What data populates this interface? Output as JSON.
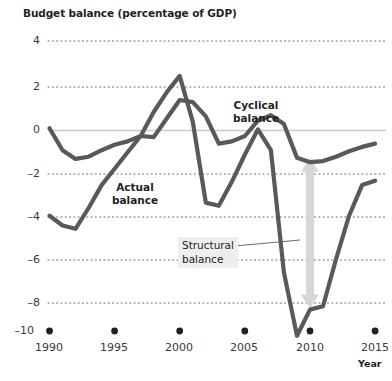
{
  "chart_data": {
    "type": "line",
    "title": "Budget balance (percentage of GDP)",
    "xlabel": "Year",
    "ylabel": "",
    "xlim": [
      1989,
      2015.6
    ],
    "ylim": [
      -10,
      4
    ],
    "grid": true,
    "grid_style": "dotted-horizontal",
    "legend_position": "inline-annotations",
    "x_ticks": [
      "1990",
      "1995",
      "2000",
      "2005",
      "2010",
      "2015"
    ],
    "x_tick_values": [
      1990,
      1995,
      2000,
      2005,
      2010,
      2015
    ],
    "y_ticks": [
      "4",
      "2",
      "0",
      "–2",
      "–4",
      "–6",
      "–8",
      "–10"
    ],
    "y_tick_values": [
      4,
      2,
      0,
      -2,
      -4,
      -6,
      -8,
      -10
    ],
    "x": [
      1990,
      1991,
      1992,
      1993,
      1994,
      1995,
      1996,
      1997,
      1998,
      1999,
      2000,
      2001,
      2002,
      2003,
      2004,
      2005,
      2006,
      2007,
      2008,
      2009,
      2010,
      2011,
      2012,
      2013,
      2014,
      2015
    ],
    "series": [
      {
        "name": "Cyclical balance",
        "color": "#58595b",
        "values": [
          0.0,
          -1.0,
          -1.4,
          -1.3,
          -1.0,
          -0.75,
          -0.6,
          -0.35,
          -0.4,
          0.45,
          1.3,
          1.2,
          0.55,
          -0.7,
          -0.6,
          -0.35,
          0.35,
          0.6,
          0.2,
          -1.35,
          -1.55,
          -1.5,
          -1.3,
          -1.05,
          -0.85,
          -0.7
        ]
      },
      {
        "name": "Structural balance",
        "alt_name": "Actual balance",
        "color": "#58595b",
        "values": [
          -4.0,
          -4.45,
          -4.6,
          -3.65,
          -2.6,
          -1.85,
          -1.1,
          -0.35,
          0.75,
          1.65,
          2.4,
          0.3,
          -3.4,
          -3.55,
          -2.45,
          -1.2,
          -0.05,
          -1.0,
          -6.6,
          -9.5,
          -8.3,
          -8.15,
          -6.0,
          -4.0,
          -2.6,
          -2.4
        ]
      }
    ],
    "annotations": [
      {
        "name": "cyclical-balance-label",
        "text_lines": [
          "Cyclical",
          "balance"
        ],
        "x_px": 255,
        "y_px": 100
      },
      {
        "name": "actual-balance-label",
        "text_lines": [
          "Actual",
          "balance"
        ],
        "x_px": 133,
        "y_px": 182
      },
      {
        "name": "structural-balance-callout",
        "text_lines": [
          "Structural",
          "balance"
        ],
        "x_px": 181,
        "y_px": 240,
        "leader_line": true
      }
    ],
    "arrow": {
      "name": "gap-arrow",
      "direction": "double-headed-vertical",
      "color": "#d6d6d6",
      "x_value": 2010,
      "y_top": -1.35,
      "y_bottom": -8.25
    },
    "colors": {
      "line": "#58595b",
      "grid": "#6d6e71",
      "zero_line": "#c9c9c9",
      "arrow": "#d6d6d6",
      "text": "#231f20",
      "callout_bg": "#eeeeee"
    }
  },
  "header": {
    "title": "Budget balance (percentage of GDP)"
  },
  "axes": {
    "x_axis_name": "Year",
    "y_labels": [
      "4",
      "2",
      "0",
      "–2",
      "–4",
      "–6",
      "–8",
      "–10"
    ],
    "x_labels": [
      "1990",
      "1995",
      "2000",
      "2005",
      "2010",
      "2015"
    ]
  },
  "labels": {
    "cyclical_line1": "Cyclical",
    "cyclical_line2": "balance",
    "actual_line1": "Actual",
    "actual_line2": "balance",
    "structural_line1": "Structural",
    "structural_line2": "balance"
  }
}
